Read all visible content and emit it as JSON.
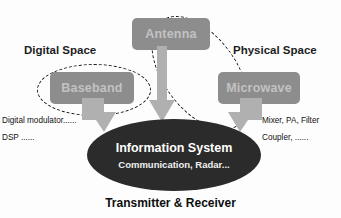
{
  "diagram": {
    "title": "Transmitter & Receiver",
    "core": {
      "title": "Information System",
      "subtitle": "Communication, Radar..."
    },
    "regions": [
      {
        "id": "digital",
        "label": "Digital Space"
      },
      {
        "id": "physical",
        "label": "Physical Space"
      }
    ],
    "modules": [
      {
        "id": "antenna",
        "label": "Antenna"
      },
      {
        "id": "baseband",
        "label": "Baseband"
      },
      {
        "id": "microwave",
        "label": "Microwave"
      }
    ],
    "annotations": {
      "left": [
        "Digital modulator......",
        "DSP ......"
      ],
      "right": [
        "Mixer, PA, Filter",
        "Coupler, ......"
      ]
    },
    "colors": {
      "module_fill": "#8d8d8d",
      "module_text": "#c2c2c2",
      "core_fill": "#2b2b2b",
      "core_text": "#ffffff",
      "arrow_fill": "#b0b0b0",
      "dash_stroke": "#1a1a1a",
      "background": "#fdfdfd"
    }
  }
}
